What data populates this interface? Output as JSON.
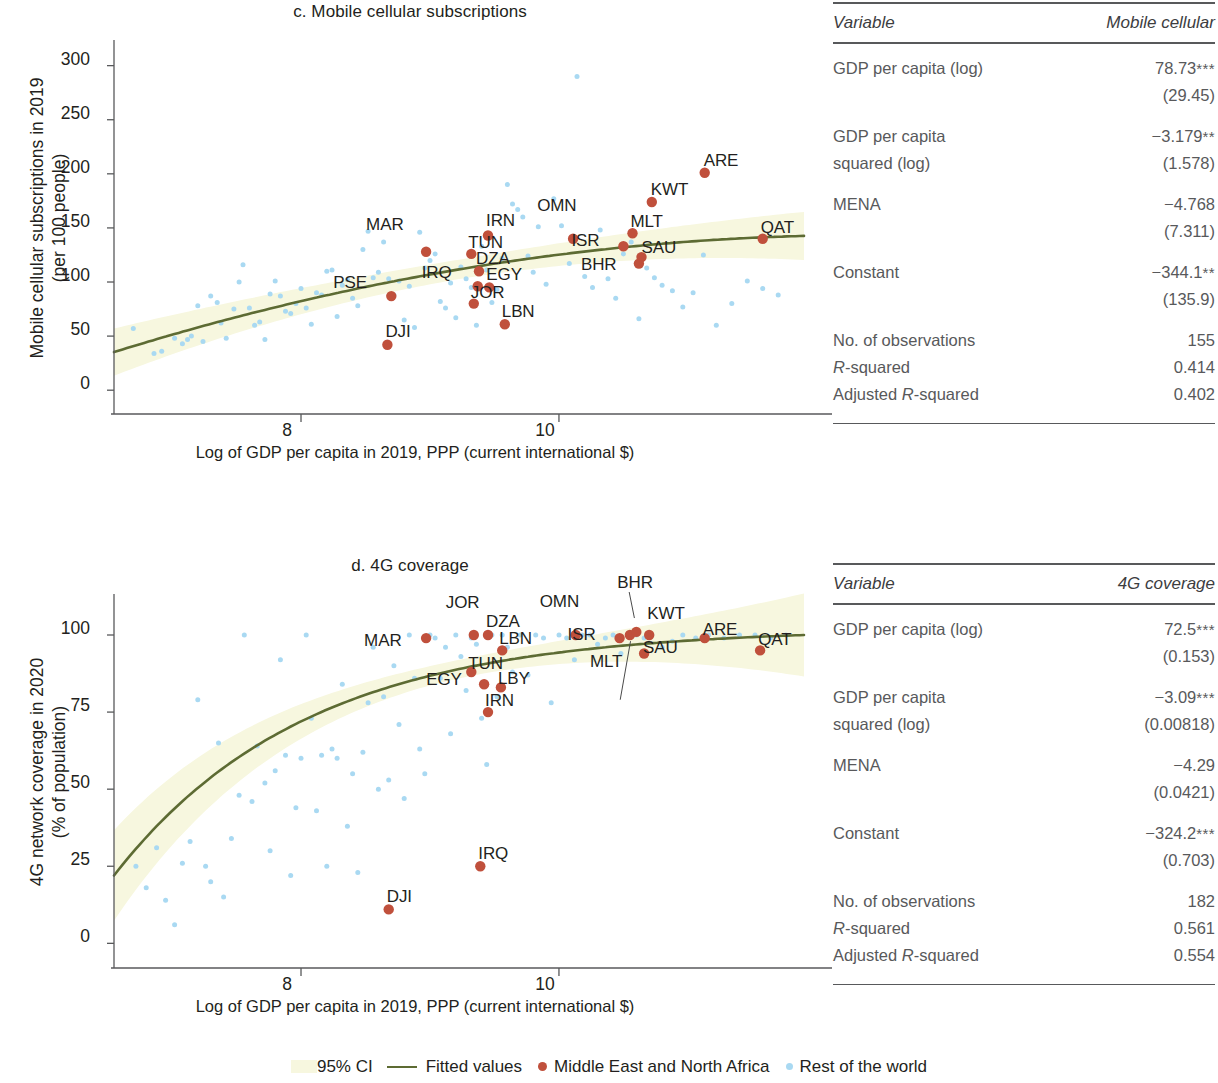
{
  "legend": {
    "ci_label": "95% CI",
    "fitted_label": "Fitted values",
    "mena_label": "Middle East and North Africa",
    "row_label": "Rest of the world",
    "ci_color": "#f7f7df",
    "fitted_color": "#5d6b33",
    "mena_color": "#c0503c",
    "row_color": "#a9d9f2"
  },
  "chart_data": [
    {
      "id": "c",
      "type": "scatter",
      "title": "c. Mobile cellular subscriptions",
      "ylabel": "Mobile cellular subscriptions in 2019\n(per 100 people)",
      "ylabel_line1": "Mobile cellular subscriptions in 2019",
      "ylabel_line2": "(per 100 people)",
      "xlabel": "Log of GDP per capita in 2019, PPP (current international $)",
      "xlim": [
        6.55,
        11.9
      ],
      "ylim": [
        -22,
        320
      ],
      "yticks": [
        0,
        50,
        100,
        150,
        200,
        250,
        300
      ],
      "xticks": [
        8,
        10
      ],
      "grid": false,
      "legend_position": "below-figure",
      "series": [
        {
          "name": "Middle East and North Africa",
          "color": "#c0503c",
          "points": [
            {
              "label": "MAR",
              "x": 8.97,
              "y": 128,
              "lx": -46,
              "ly": -22
            },
            {
              "label": "PSE",
              "x": 8.7,
              "y": 87,
              "lx": -44,
              "ly": -8
            },
            {
              "label": "DJI",
              "x": 8.67,
              "y": 42,
              "lx": 12,
              "ly": -8
            },
            {
              "label": "IRN",
              "x": 9.45,
              "y": 143,
              "lx": 12,
              "ly": -9
            },
            {
              "label": "TUN",
              "x": 9.32,
              "y": 126,
              "lx": 11,
              "ly": -6
            },
            {
              "label": "DZA",
              "x": 9.38,
              "y": 110,
              "lx": 11,
              "ly": -7
            },
            {
              "label": "IRQ",
              "x": 9.37,
              "y": 96,
              "lx": -42,
              "ly": -8
            },
            {
              "label": "EGY",
              "x": 9.46,
              "y": 95,
              "lx": 11,
              "ly": -7
            },
            {
              "label": "JOR",
              "x": 9.34,
              "y": 80,
              "lx": 11,
              "ly": -6
            },
            {
              "label": "LBN",
              "x": 9.58,
              "y": 61,
              "lx": 11,
              "ly": -7
            },
            {
              "label": "OMN",
              "x": 10.11,
              "y": 140,
              "lx": -22,
              "ly": -28
            },
            {
              "label": "ISR",
              "x": 10.5,
              "y": 133,
              "lx": -38,
              "ly": 0
            },
            {
              "label": "MLT",
              "x": 10.57,
              "y": 145,
              "lx": 12,
              "ly": -6
            },
            {
              "label": "BHR",
              "x": 10.62,
              "y": 117,
              "lx": -44,
              "ly": 6
            },
            {
              "label": "SAU",
              "x": 10.64,
              "y": 123,
              "lx": 14,
              "ly": -4
            },
            {
              "label": "KWT",
              "x": 10.72,
              "y": 174,
              "lx": 13,
              "ly": -7
            },
            {
              "label": "ARE",
              "x": 11.13,
              "y": 201,
              "lx": 13,
              "ly": -7
            },
            {
              "label": "QAT",
              "x": 11.58,
              "y": 140,
              "lx": 12,
              "ly": -6
            }
          ]
        },
        {
          "name": "Rest of the world",
          "color": "#a9d9f2",
          "x": [
            6.7,
            6.86,
            6.92,
            7.02,
            7.08,
            7.12,
            7.15,
            7.2,
            7.24,
            7.3,
            7.35,
            7.38,
            7.42,
            7.48,
            7.52,
            7.55,
            7.6,
            7.64,
            7.68,
            7.72,
            7.76,
            7.8,
            7.84,
            7.88,
            7.92,
            7.96,
            8.0,
            8.04,
            8.08,
            8.12,
            8.16,
            8.2,
            8.24,
            8.28,
            8.32,
            8.36,
            8.4,
            8.44,
            8.48,
            8.52,
            8.56,
            8.6,
            8.64,
            8.68,
            8.72,
            8.76,
            8.8,
            8.84,
            8.88,
            8.92,
            8.96,
            9.0,
            9.04,
            9.08,
            9.12,
            9.16,
            9.2,
            9.24,
            9.28,
            9.32,
            9.36,
            9.4,
            9.44,
            9.48,
            9.52,
            9.56,
            9.6,
            9.64,
            9.68,
            9.72,
            9.76,
            9.8,
            9.84,
            9.9,
            9.96,
            10.02,
            10.08,
            10.14,
            10.2,
            10.26,
            10.32,
            10.38,
            10.44,
            10.5,
            10.56,
            10.62,
            10.68,
            10.74,
            10.8,
            10.88,
            10.96,
            11.04,
            11.12,
            11.22,
            11.34,
            11.46,
            11.58,
            11.7
          ],
          "y": [
            57,
            34,
            36,
            48,
            43,
            47,
            50,
            78,
            45,
            87,
            81,
            62,
            48,
            75,
            100,
            116,
            76,
            60,
            63,
            47,
            89,
            101,
            87,
            73,
            71,
            80,
            94,
            76,
            61,
            90,
            88,
            110,
            111,
            68,
            97,
            102,
            85,
            78,
            130,
            147,
            104,
            109,
            137,
            103,
            88,
            101,
            65,
            96,
            58,
            146,
            113,
            120,
            126,
            82,
            76,
            99,
            67,
            114,
            103,
            95,
            60,
            133,
            111,
            81,
            93,
            122,
            190,
            172,
            167,
            160,
            124,
            109,
            151,
            98,
            177,
            152,
            117,
            290,
            105,
            95,
            148,
            103,
            85,
            126,
            137,
            66,
            113,
            104,
            97,
            92,
            77,
            90,
            125,
            60,
            80,
            101,
            94,
            88
          ]
        }
      ],
      "fit_curve": {
        "color": "#5d6b33",
        "width": 2.6
      },
      "ci_band": {
        "color": "#f7f7df"
      }
    },
    {
      "id": "d",
      "type": "scatter",
      "title": "d. 4G coverage",
      "ylabel_line1": "4G network coverage in 2020",
      "ylabel_line2": "(% of population)",
      "xlabel": "Log of GDP per capita in 2019, PPP (current international $)",
      "xlim": [
        6.55,
        11.9
      ],
      "ylim": [
        -8,
        112
      ],
      "yticks": [
        0,
        25,
        50,
        75,
        100
      ],
      "xticks": [
        8,
        10
      ],
      "grid": false,
      "legend_position": "below-figure",
      "series": [
        {
          "name": "Middle East and North Africa",
          "color": "#c0503c",
          "points": [
            {
              "label": "MAR",
              "x": 8.97,
              "y": 99,
              "lx": -48,
              "ly": 8
            },
            {
              "label": "JOR",
              "x": 9.34,
              "y": 100,
              "lx": -14,
              "ly": -27
            },
            {
              "label": "DZA",
              "x": 9.45,
              "y": 100,
              "lx": 12,
              "ly": -8
            },
            {
              "label": "LBN",
              "x": 9.56,
              "y": 95,
              "lx": 11,
              "ly": -6
            },
            {
              "label": "TUN",
              "x": 9.32,
              "y": 88,
              "lx": 11,
              "ly": -3
            },
            {
              "label": "EGY",
              "x": 9.42,
              "y": 84,
              "lx": -44,
              "ly": 1
            },
            {
              "label": "LBY",
              "x": 9.55,
              "y": 83,
              "lx": 11,
              "ly": -3
            },
            {
              "label": "IRN",
              "x": 9.45,
              "y": 75,
              "lx": 11,
              "ly": -6
            },
            {
              "label": "IRQ",
              "x": 9.39,
              "y": 25,
              "lx": 12,
              "ly": -7
            },
            {
              "label": "DJI",
              "x": 8.68,
              "y": 11,
              "lx": 12,
              "ly": -7
            },
            {
              "label": "OMN",
              "x": 10.13,
              "y": 100,
              "lx": -22,
              "ly": -28
            },
            {
              "label": "ISR",
              "x": 10.47,
              "y": 99,
              "lx": -38,
              "ly": 2
            },
            {
              "label": "MLT",
              "x": 10.55,
              "y": 100,
              "lx": -26,
              "ly": 32
            },
            {
              "label": "BHR",
              "x": 10.6,
              "y": 101,
              "lx": -5,
              "ly": -44
            },
            {
              "label": "KWT",
              "x": 10.7,
              "y": 100,
              "lx": 12,
              "ly": -16
            },
            {
              "label": "SAU",
              "x": 10.66,
              "y": 94,
              "lx": 13,
              "ly": -1
            },
            {
              "label": "ARE",
              "x": 11.13,
              "y": 99,
              "lx": 12,
              "ly": -3
            },
            {
              "label": "QAT",
              "x": 11.56,
              "y": 95,
              "lx": 12,
              "ly": -5
            }
          ]
        },
        {
          "name": "Rest of the world",
          "color": "#a9d9f2",
          "x": [
            6.72,
            6.8,
            6.88,
            6.95,
            7.02,
            7.08,
            7.14,
            7.2,
            7.26,
            7.3,
            7.36,
            7.4,
            7.46,
            7.52,
            7.56,
            7.62,
            7.66,
            7.72,
            7.76,
            7.8,
            7.84,
            7.88,
            7.92,
            7.96,
            8.0,
            8.04,
            8.08,
            8.12,
            8.16,
            8.2,
            8.24,
            8.28,
            8.32,
            8.36,
            8.4,
            8.44,
            8.48,
            8.52,
            8.56,
            8.6,
            8.64,
            8.68,
            8.72,
            8.76,
            8.8,
            8.84,
            8.88,
            8.92,
            8.96,
            9.0,
            9.04,
            9.08,
            9.12,
            9.16,
            9.2,
            9.24,
            9.28,
            9.32,
            9.36,
            9.4,
            9.44,
            9.48,
            9.52,
            9.56,
            9.6,
            9.64,
            9.7,
            9.76,
            9.82,
            9.88,
            9.94,
            10.0,
            10.06,
            10.12,
            10.18,
            10.24,
            10.3,
            10.36,
            10.42,
            10.48,
            10.54,
            10.6,
            10.66,
            10.72,
            10.8,
            10.88,
            10.96,
            11.06,
            11.16,
            11.28,
            11.4,
            11.52,
            11.64,
            11.76
          ],
          "y": [
            25,
            18,
            31,
            14,
            6,
            26,
            33,
            79,
            25,
            20,
            65,
            15,
            34,
            48,
            100,
            46,
            64,
            52,
            30,
            56,
            92,
            61,
            22,
            44,
            60,
            100,
            73,
            43,
            61,
            25,
            63,
            60,
            84,
            38,
            55,
            23,
            62,
            78,
            96,
            50,
            80,
            53,
            90,
            71,
            47,
            100,
            86,
            63,
            55,
            100,
            99,
            86,
            96,
            68,
            100,
            93,
            82,
            99,
            97,
            73,
            58,
            100,
            80,
            100,
            96,
            88,
            100,
            87,
            100,
            99,
            78,
            100,
            99,
            92,
            100,
            100,
            97,
            99,
            100,
            94,
            100,
            100,
            99,
            100,
            96,
            98,
            100,
            99,
            100,
            99,
            100,
            100,
            99,
            100
          ]
        }
      ],
      "fit_curve": {
        "color": "#5d6b33",
        "width": 2.6
      },
      "ci_band": {
        "color": "#f7f7df"
      }
    }
  ],
  "tables": [
    {
      "id": "mobile-cellular",
      "col_variable": "Variable",
      "col_value": "Mobile cellular",
      "rows": [
        {
          "kind": "coef",
          "label": "GDP per capita (log)",
          "value": "78.73",
          "stars": "***",
          "se": "(29.45)"
        },
        {
          "kind": "coef",
          "label": "GDP per capita",
          "label2": "squared (log)",
          "value": "−3.179",
          "stars": "**",
          "se": "(1.578)"
        },
        {
          "kind": "coef",
          "label": "MENA",
          "value": "−4.768",
          "stars": "",
          "se": "(7.311)"
        },
        {
          "kind": "coef",
          "label": "Constant",
          "value": "−344.1",
          "stars": "**",
          "se": "(135.9)"
        }
      ],
      "stats": [
        {
          "label": "No. of observations",
          "value": "155"
        },
        {
          "label": "R-squared",
          "italic_prefix": "R",
          "value": "0.414"
        },
        {
          "label": "Adjusted R-squared",
          "italic_prefix": "Adjusted R",
          "value": "0.402"
        }
      ]
    },
    {
      "id": "4g-coverage",
      "col_variable": "Variable",
      "col_value": "4G coverage",
      "rows": [
        {
          "kind": "coef",
          "label": "GDP per capita (log)",
          "value": "72.5",
          "stars": "***",
          "se": "(0.153)"
        },
        {
          "kind": "coef",
          "label": "GDP per capita",
          "label2": "squared (log)",
          "value": "−3.09",
          "stars": "***",
          "se": "(0.00818)"
        },
        {
          "kind": "coef",
          "label": "MENA",
          "value": "−4.29",
          "stars": "",
          "se": "(0.0421)"
        },
        {
          "kind": "coef",
          "label": "Constant",
          "value": "−324.2",
          "stars": "***",
          "se": "(0.703)"
        }
      ],
      "stats": [
        {
          "label": "No. of observations",
          "value": "182"
        },
        {
          "label": "R-squared",
          "italic_prefix": "R",
          "value": "0.561"
        },
        {
          "label": "Adjusted R-squared",
          "italic_prefix": "Adjusted R",
          "value": "0.554"
        }
      ]
    }
  ]
}
